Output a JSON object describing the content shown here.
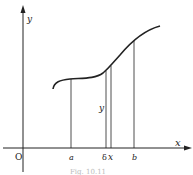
{
  "figure": {
    "axes": {
      "x_label": "x",
      "y_label": "y",
      "origin_label": "O"
    },
    "points": {
      "a_label": "a",
      "delta_label": "δ",
      "x_label": "x",
      "b_label": "b"
    },
    "ordinate_label": "y",
    "caption": "Fig. 10.11",
    "colors": {
      "line": "#222222",
      "background": "#ffffff"
    }
  }
}
